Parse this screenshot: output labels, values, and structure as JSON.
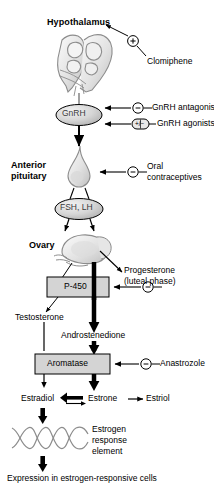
{
  "diagram": {
    "type": "biological-pathway-flowchart",
    "colors": {
      "stroke": "#000000",
      "organ_outline": "#8c8c8c",
      "box_fill": "#d4d4d4",
      "oval_fill": "#d9d9d9",
      "dna_stroke": "#8c8c8c",
      "background": "#ffffff"
    },
    "nodes": {
      "hypothalamus": "Hypothalamus",
      "gnrh": "GnRH",
      "anterior_pituitary_line1": "Anterior",
      "anterior_pituitary_line2": "pituitary",
      "fsh_lh": "FSH, LH",
      "ovary": "Ovary",
      "p450": "P-450",
      "aromatase": "Aromatase",
      "testosterone": "Testosterone",
      "androstenedione": "Androstenedione",
      "estradiol": "Estradiol",
      "estrone": "Estrone",
      "estriol": "Estriol",
      "progesterone_line1": "Progesterone",
      "progesterone_line2": "(luteal phase)",
      "ere_line1": "Estrogen",
      "ere_line2": "response",
      "ere_line3": "element",
      "expression": "Expression in estrogen-responsive cells"
    },
    "drugs": [
      {
        "name": "Clomiphene",
        "effect": "+",
        "target": "hypothalamus",
        "symbol": "plus-circle"
      },
      {
        "name": "GnRH antagonists",
        "effect": "−",
        "target": "gnrh",
        "symbol": "minus-circle"
      },
      {
        "name": "GnRH agonists",
        "effect": "+/−",
        "target": "gnrh",
        "symbol": "plus-minus-box"
      },
      {
        "name": "Oral contraceptives",
        "effect": "−",
        "target": "anterior-pituitary",
        "symbol": "minus-circle"
      },
      {
        "name": "Ketoconazole",
        "effect": "−",
        "target": "p450",
        "symbol": "minus-circle"
      },
      {
        "name": "Anastrozole",
        "effect": "−",
        "target": "aromatase",
        "symbol": "minus-circle"
      }
    ],
    "drug_labels": {
      "clomiphene": "Clomiphene",
      "gnrh_antagonists": "GnRH antagonists",
      "gnrh_agonists": "GnRH agonists",
      "oral_contraceptives_line1": "Oral",
      "oral_contraceptives_line2": "contraceptives",
      "ketoconazole": "Ketoconazole",
      "anastrozole": "Anastrozole"
    },
    "effect_symbols": {
      "plus": "+",
      "minus": "−",
      "plus_minus": "+/−"
    }
  }
}
